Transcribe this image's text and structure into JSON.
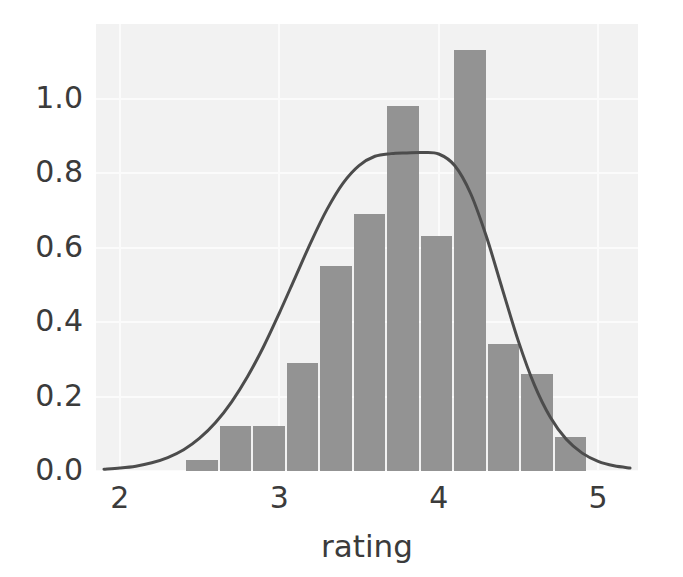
{
  "chart_data": {
    "type": "bar",
    "title": "",
    "subtitle": "",
    "xlabel": "rating",
    "ylabel": "",
    "xlim": [
      1.85,
      5.25
    ],
    "ylim": [
      0.0,
      1.2
    ],
    "xticks": [
      "2",
      "3",
      "4",
      "5"
    ],
    "xtick_values": [
      2,
      3,
      4,
      5
    ],
    "yticks": [
      "0.0",
      "0.2",
      "0.4",
      "0.6",
      "0.8",
      "1.0"
    ],
    "ytick_values": [
      0.0,
      0.2,
      0.4,
      0.6,
      0.8,
      1.0
    ],
    "grid": true,
    "legend": "none",
    "bin_width": 0.21,
    "bin_edges": [
      2.41,
      2.62,
      2.83,
      3.04,
      3.25,
      3.46,
      3.67,
      3.88,
      4.09,
      4.3,
      4.51,
      4.72,
      4.93
    ],
    "categories": [
      "2.41-2.62",
      "2.62-2.83",
      "2.83-3.04",
      "3.04-3.25",
      "3.25-3.46",
      "3.46-3.67",
      "3.67-3.88",
      "3.88-4.09",
      "4.09-4.30",
      "4.30-4.51",
      "4.51-4.72",
      "4.72-4.93"
    ],
    "values": [
      0.03,
      0.12,
      0.12,
      0.29,
      0.55,
      0.69,
      0.98,
      0.63,
      1.13,
      0.34,
      0.26,
      0.09
    ],
    "series": [
      {
        "name": "histogram",
        "kind": "bar",
        "color": "#939393",
        "values": [
          0.03,
          0.12,
          0.12,
          0.29,
          0.55,
          0.69,
          0.98,
          0.63,
          1.13,
          0.34,
          0.26,
          0.09
        ]
      },
      {
        "name": "kde",
        "kind": "line",
        "color": "#4c4c4c",
        "peak_x": 3.98,
        "peak_y": 0.855,
        "x": [
          1.9,
          2.0,
          2.1,
          2.2,
          2.3,
          2.4,
          2.5,
          2.6,
          2.7,
          2.8,
          2.9,
          3.0,
          3.1,
          3.2,
          3.3,
          3.4,
          3.5,
          3.6,
          3.7,
          3.8,
          3.9,
          4.0,
          4.1,
          4.2,
          4.3,
          4.4,
          4.5,
          4.6,
          4.7,
          4.8,
          4.9,
          5.0,
          5.1,
          5.2
        ],
        "y": [
          0.005,
          0.008,
          0.013,
          0.022,
          0.036,
          0.057,
          0.088,
          0.13,
          0.185,
          0.253,
          0.333,
          0.424,
          0.52,
          0.616,
          0.703,
          0.773,
          0.82,
          0.845,
          0.852,
          0.854,
          0.855,
          0.851,
          0.82,
          0.745,
          0.628,
          0.487,
          0.348,
          0.231,
          0.144,
          0.085,
          0.048,
          0.026,
          0.014,
          0.008
        ]
      }
    ]
  },
  "axes": {
    "background_color": "#f2f2f2",
    "gridline_color": "#fbfbfb",
    "tick_label_color": "#3b3b3b",
    "figure_background": "#ffffff"
  }
}
